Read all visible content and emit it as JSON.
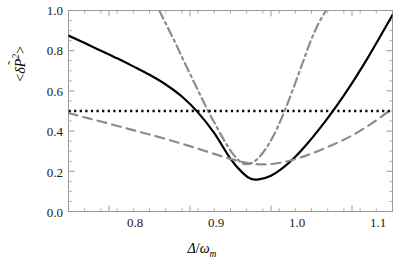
{
  "chart_data": {
    "type": "line",
    "title": "",
    "xlabel": "Δ/ω_m",
    "ylabel": "<δP̃²>",
    "xlim": [
      0.75,
      1.15
    ],
    "ylim": [
      0.0,
      1.0
    ],
    "grid": false,
    "legend": "none",
    "x_ticks": [
      "0.8",
      "0.9",
      "1.0",
      "1.1"
    ],
    "x_tick_values": [
      0.8,
      0.9,
      1.0,
      1.1
    ],
    "x_minor_tick_step": 0.02,
    "y_ticks": [
      "0.0",
      "0.2",
      "0.4",
      "0.6",
      "0.8",
      "1.0"
    ],
    "y_tick_values": [
      0.0,
      0.2,
      0.4,
      0.6,
      0.8,
      1.0
    ],
    "y_minor_tick_step": 0.05,
    "series": [
      {
        "name": "solid-black-curve",
        "style": "solid",
        "color": "#000000",
        "width": 2.2,
        "minimum": {
          "x": 0.975,
          "y": 0.16
        },
        "x": [
          0.75,
          0.77,
          0.79,
          0.81,
          0.83,
          0.85,
          0.87,
          0.89,
          0.91,
          0.93,
          0.95,
          0.965,
          0.975,
          0.985,
          1.0,
          1.015,
          1.03,
          1.045,
          1.06,
          1.075,
          1.09,
          1.105,
          1.12,
          1.135,
          1.15
        ],
        "y": [
          0.875,
          0.838,
          0.8,
          0.762,
          0.722,
          0.68,
          0.632,
          0.572,
          0.492,
          0.39,
          0.262,
          0.192,
          0.163,
          0.16,
          0.178,
          0.218,
          0.272,
          0.338,
          0.412,
          0.492,
          0.578,
          0.67,
          0.768,
          0.872,
          0.978
        ]
      },
      {
        "name": "gray-dashed-curve",
        "style": "dashed",
        "color": "#8c8c8c",
        "width": 2.2,
        "minimum": {
          "x": 0.975,
          "y": 0.235
        },
        "x": [
          0.75,
          0.775,
          0.8,
          0.825,
          0.85,
          0.875,
          0.9,
          0.925,
          0.95,
          0.975,
          1.0,
          1.025,
          1.05,
          1.075,
          1.1,
          1.125,
          1.15
        ],
        "y": [
          0.49,
          0.463,
          0.437,
          0.41,
          0.383,
          0.355,
          0.325,
          0.293,
          0.262,
          0.238,
          0.236,
          0.255,
          0.288,
          0.33,
          0.378,
          0.44,
          0.512
        ]
      },
      {
        "name": "gray-dashdot-curve",
        "style": "dashdot",
        "color": "#8c8c8c",
        "width": 2.2,
        "minimum": {
          "x": 0.968,
          "y": 0.235
        },
        "x": [
          0.862,
          0.872,
          0.882,
          0.892,
          0.902,
          0.912,
          0.922,
          0.932,
          0.942,
          0.952,
          0.962,
          0.968,
          0.978,
          0.988,
          0.998,
          1.008,
          1.018,
          1.028,
          1.038,
          1.048,
          1.058,
          1.068
        ],
        "y": [
          1.0,
          0.92,
          0.838,
          0.752,
          0.668,
          0.585,
          0.503,
          0.428,
          0.355,
          0.292,
          0.248,
          0.236,
          0.245,
          0.282,
          0.34,
          0.418,
          0.512,
          0.618,
          0.728,
          0.838,
          0.93,
          1.0
        ]
      },
      {
        "name": "black-dotted-horizontal-line",
        "style": "dotted",
        "color": "#000000",
        "width": 2.6,
        "constant_y": 0.5,
        "x": [
          0.75,
          1.15
        ],
        "y": [
          0.5,
          0.5
        ]
      }
    ]
  },
  "axes": {
    "x_title_delta": "Δ",
    "x_title_slash": "/",
    "x_title_omega": "ω",
    "x_title_sub": "m",
    "y_title_open": "<",
    "y_title_delta": "δ",
    "y_title_p": "P",
    "y_title_tilde": "˜",
    "y_title_sup": "2",
    "y_title_close": ">"
  }
}
